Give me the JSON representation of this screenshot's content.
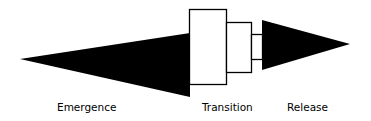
{
  "diagram": {
    "type": "process-phase-diagram",
    "colors": {
      "fill": "#000000",
      "stroke": "#000000",
      "background": "#ffffff"
    },
    "phases": [
      {
        "id": "emergence",
        "label": "Emergence",
        "shape": "wedge-expanding"
      },
      {
        "id": "transition",
        "label": "Transition",
        "shape": "stepped-boxes"
      },
      {
        "id": "release",
        "label": "Release",
        "shape": "wedge-tapering"
      }
    ]
  }
}
